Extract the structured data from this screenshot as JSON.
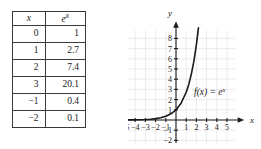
{
  "figure": {
    "caption": "",
    "table": {
      "name": "exponential-values-table",
      "headers": [
        "x",
        "e^x"
      ],
      "header_base": [
        "x",
        "e"
      ],
      "header_exponent": [
        "",
        "x"
      ],
      "rows": [
        {
          "x": "0",
          "y": "1"
        },
        {
          "x": "1",
          "y": "2.7"
        },
        {
          "x": "2",
          "y": "7.4"
        },
        {
          "x": "3",
          "y": "20.1"
        },
        {
          "x": "−1",
          "y": "0.4"
        },
        {
          "x": "−2",
          "y": "0.1"
        }
      ]
    }
  },
  "chart_data": {
    "type": "line",
    "title": "",
    "xlabel": "x",
    "ylabel": "y",
    "function_label_base": "f(x) = e",
    "function_label_exponent": "x",
    "grid": true,
    "legend": "none",
    "xlim": [
      -5.8,
      5.8
    ],
    "ylim": [
      -2.6,
      8.8
    ],
    "xticks": [
      "−5",
      "−4",
      "−3",
      "−2",
      "−1",
      "1",
      "2",
      "3",
      "4",
      "5"
    ],
    "xtick_values": [
      -5,
      -4,
      -3,
      -2,
      -1,
      1,
      2,
      3,
      4,
      5
    ],
    "yticks": [
      "8",
      "7",
      "6",
      "5",
      "4",
      "3",
      "2",
      "1",
      "−1",
      "−2"
    ],
    "ytick_values": [
      8,
      7,
      6,
      5,
      4,
      3,
      2,
      1,
      -1,
      -2
    ],
    "series": [
      {
        "name": "f(x) = e^x",
        "color": "#1a1a1a",
        "x": [
          -5,
          -4,
          -3,
          -2.5,
          -2,
          -1.5,
          -1,
          -0.5,
          0,
          0.5,
          1,
          1.25,
          1.5,
          1.75,
          2,
          2.1,
          2.2
        ],
        "values": [
          0.007,
          0.018,
          0.05,
          0.08,
          0.135,
          0.223,
          0.368,
          0.607,
          1,
          1.649,
          2.718,
          3.49,
          4.482,
          5.755,
          7.389,
          8.17,
          9.03
        ]
      }
    ],
    "colors": {
      "curve": "#1a1a1a",
      "axis": "#1a1a1a",
      "grid": "#d8d8dc",
      "background": "#ffffff"
    }
  }
}
